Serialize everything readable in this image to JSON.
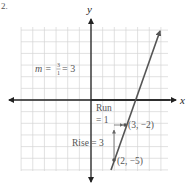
{
  "problem_number": "2.",
  "axes": {
    "x_label": "x",
    "y_label": "y",
    "x_range": [
      -6,
      6
    ],
    "y_range": [
      -6,
      6
    ]
  },
  "slope_annotation": {
    "m_prefix": "m = ",
    "numerator": "3",
    "denominator": "1",
    "result": "= 3"
  },
  "run_label_line1": "Run",
  "run_label_line2": "= 1",
  "rise_label": "Rise = 3",
  "points": [
    {
      "label": "(3, −2)",
      "x": 3,
      "y": -2
    },
    {
      "label": "(2, −5)",
      "x": 2,
      "y": -5
    }
  ],
  "colors": {
    "grid": "#d0d0d0",
    "axis": "#222222",
    "line": "#555555",
    "text": "#555555"
  }
}
